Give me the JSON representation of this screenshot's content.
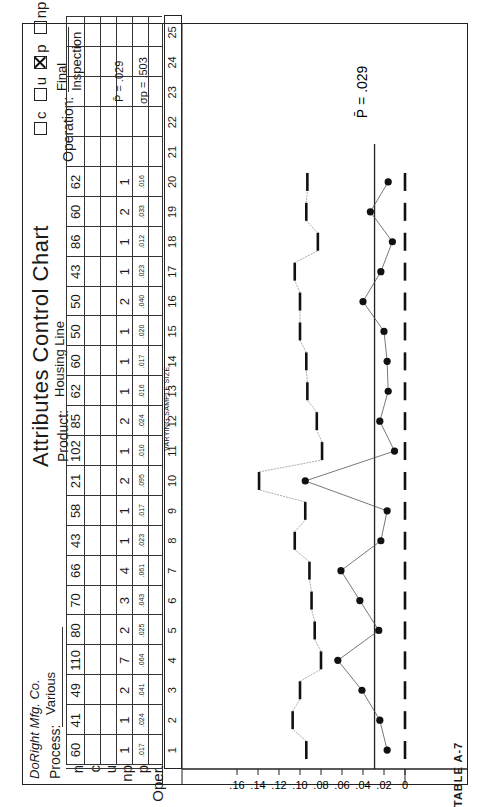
{
  "header": {
    "company": "DoRight Mfg. Co.",
    "title": "Attributes Control Chart",
    "process_label": "Process:",
    "process_value": "Various",
    "product_label": "Product:",
    "product_value": "Housing Line",
    "operation_label": "Operation:",
    "operation_value": "Final Inspection",
    "chart_types": [
      {
        "label": "c",
        "checked": false
      },
      {
        "label": "u",
        "checked": false
      },
      {
        "label": "p",
        "checked": true
      },
      {
        "label": "np",
        "checked": false
      }
    ]
  },
  "row_labels": {
    "n": "n",
    "c": "c",
    "u": "u",
    "np": "np",
    "p": "p",
    "oper": "Oper."
  },
  "stats": {
    "pbar": "P̄ = .029",
    "sigma": "σp = .503"
  },
  "sample_size_note": "VARYING SAMPLE SIZE",
  "caption": "TABLE A-7",
  "columns": [
    "1",
    "2",
    "3",
    "4",
    "5",
    "6",
    "7",
    "8",
    "9",
    "10",
    "11",
    "12",
    "13",
    "14",
    "15",
    "16",
    "17",
    "18",
    "19",
    "20",
    "21",
    "22",
    "23",
    "24",
    "25"
  ],
  "table": {
    "n": [
      "60",
      "41",
      "49",
      "110",
      "80",
      "70",
      "66",
      "43",
      "58",
      "21",
      "102",
      "85",
      "62",
      "60",
      "50",
      "50",
      "43",
      "86",
      "60",
      "62"
    ],
    "np": [
      "1",
      "1",
      "2",
      "7",
      "2",
      "3",
      "4",
      "1",
      "1",
      "2",
      "1",
      "2",
      "1",
      "1",
      "1",
      "2",
      "1",
      "1",
      "2",
      "1"
    ],
    "p": [
      ".017",
      ".024",
      ".041",
      ".064",
      ".025",
      ".043",
      ".061",
      ".023",
      ".017",
      ".095",
      ".010",
      ".024",
      ".016",
      ".017",
      ".020",
      ".040",
      ".023",
      ".012",
      ".033",
      ".016"
    ]
  },
  "chart_data": {
    "type": "line",
    "xlabel": "Subgroup",
    "ylabel": "p (fraction defective)",
    "x": [
      1,
      2,
      3,
      4,
      5,
      6,
      7,
      8,
      9,
      10,
      11,
      12,
      13,
      14,
      15,
      16,
      17,
      18,
      19,
      20
    ],
    "series": [
      {
        "name": "p",
        "values": [
          0.017,
          0.024,
          0.041,
          0.064,
          0.025,
          0.043,
          0.061,
          0.023,
          0.017,
          0.095,
          0.01,
          0.024,
          0.016,
          0.017,
          0.02,
          0.04,
          0.023,
          0.012,
          0.033,
          0.016
        ]
      },
      {
        "name": "UCL",
        "values": [
          0.094,
          0.107,
          0.1,
          0.08,
          0.086,
          0.089,
          0.091,
          0.105,
          0.095,
          0.139,
          0.079,
          0.084,
          0.093,
          0.094,
          0.1,
          0.1,
          0.105,
          0.083,
          0.094,
          0.093
        ]
      },
      {
        "name": "CL (p̄)",
        "values": [
          0.029,
          0.029,
          0.029,
          0.029,
          0.029,
          0.029,
          0.029,
          0.029,
          0.029,
          0.029,
          0.029,
          0.029,
          0.029,
          0.029,
          0.029,
          0.029,
          0.029,
          0.029,
          0.029,
          0.029
        ]
      },
      {
        "name": "LCL",
        "values": [
          0,
          0,
          0,
          0,
          0,
          0,
          0,
          0,
          0,
          0,
          0,
          0,
          0,
          0,
          0,
          0,
          0,
          0,
          0,
          0
        ]
      }
    ],
    "yticks": [
      "0",
      ".02",
      ".04",
      ".06",
      ".08",
      ".10",
      ".12",
      ".14",
      ".16"
    ],
    "ylim": [
      0,
      0.17
    ],
    "annotation": "P̄ = .029",
    "grid": false
  }
}
